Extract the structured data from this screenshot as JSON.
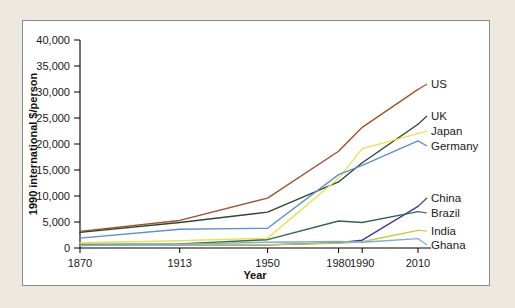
{
  "figure": {
    "background_color": "#ede9e0",
    "panel_color": "#ffffff",
    "border_color": "#8c8c86"
  },
  "chart_data": {
    "type": "line",
    "title": "",
    "xlabel": "Year",
    "ylabel": "1990 international $/person",
    "categories": [
      "1870",
      "1913",
      "1950",
      "1980",
      "1990",
      "2010"
    ],
    "x": [
      1870,
      1913,
      1950,
      1980,
      1990,
      2010
    ],
    "xtick_labels": [
      "1870",
      "1913",
      "1950",
      "1980",
      "1990",
      "2010"
    ],
    "ytick_labels": [
      "0",
      "5,000",
      "10,000",
      "15,000",
      "20,000",
      "25,000",
      "30,000",
      "35,000",
      "40,000"
    ],
    "ytick_values": [
      0,
      5000,
      10000,
      15000,
      20000,
      25000,
      30000,
      35000,
      40000
    ],
    "ylim": [
      0,
      40000
    ],
    "grid": false,
    "legend_position": "right-inline",
    "series": [
      {
        "name": "US",
        "color": "#a0522d",
        "label": "US",
        "values": [
          3200,
          5300,
          9600,
          18600,
          23200,
          30500
        ]
      },
      {
        "name": "UK",
        "color": "#2b4a2b",
        "label": "UK",
        "values": [
          3000,
          4900,
          6900,
          12700,
          16400,
          23800
        ]
      },
      {
        "name": "Japan",
        "color": "#e8e44a",
        "label": "Japan",
        "values": [
          1000,
          1400,
          1900,
          13400,
          19100,
          22000
        ]
      },
      {
        "name": "Germany",
        "color": "#5b8fd4",
        "label": "Germany",
        "values": [
          1900,
          3600,
          3800,
          14100,
          15900,
          20600
        ]
      },
      {
        "name": "China",
        "color": "#3b3b9e",
        "label": "China",
        "values": [
          600,
          600,
          600,
          1000,
          1500,
          8000
        ]
      },
      {
        "name": "Brazil",
        "color": "#2f6b46",
        "label": "Brazil",
        "values": [
          700,
          800,
          1600,
          5200,
          4900,
          7000
        ]
      },
      {
        "name": "India",
        "color": "#cbc83c",
        "label": "India",
        "values": [
          550,
          650,
          650,
          900,
          1200,
          3400
        ]
      },
      {
        "name": "Ghana",
        "color": "#7aaede",
        "label": "Ghana",
        "values": [
          450,
          750,
          1100,
          1250,
          1100,
          1800
        ]
      }
    ]
  }
}
